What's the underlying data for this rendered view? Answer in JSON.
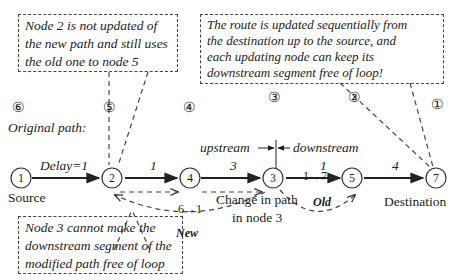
{
  "notes": {
    "node2": [
      "Node 2 is not updated of",
      "the new path and still uses",
      "the old one to node 5"
    ],
    "route": [
      "The route is updated sequentially from",
      "the destination  up to the source, and",
      "each updating node can keep its",
      "downstream segment free of loop!"
    ],
    "node3": [
      "Node 3 cannot make the",
      "downstream segment of the",
      "modified path free of loop"
    ]
  },
  "step_labels": [
    "⑥",
    "⑤",
    "④",
    "③",
    "②",
    "①"
  ],
  "original_path_label": "Original path:",
  "nodes": [
    {
      "id": "1",
      "label": "Source"
    },
    {
      "id": "2"
    },
    {
      "id": "4"
    },
    {
      "id": "3"
    },
    {
      "id": "5"
    },
    {
      "id": "7",
      "label": "Destination"
    }
  ],
  "edges": [
    {
      "from": "1",
      "to": "2",
      "delay": "Delay=1"
    },
    {
      "from": "2",
      "to": "4",
      "delay": "1"
    },
    {
      "from": "4",
      "to": "3",
      "delay": "3"
    },
    {
      "from": "3",
      "to": "5",
      "delay": "1"
    },
    {
      "from": "5",
      "to": "7",
      "delay": "4"
    }
  ],
  "upstream_label": "upstream",
  "downstream_label": "downstream",
  "new_change": "6→1",
  "new_label": "New",
  "old_change": "1→7",
  "old_label": "Old",
  "change_caption": [
    "Change in path",
    "in node 3"
  ]
}
